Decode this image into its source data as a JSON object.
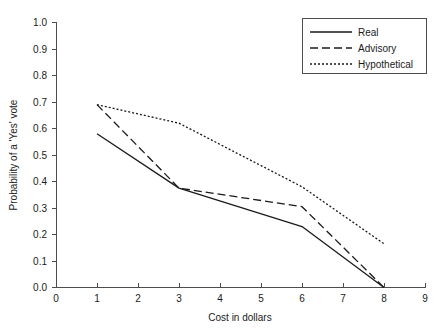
{
  "chart_data": {
    "type": "line",
    "title": "",
    "xlabel": "Cost in dollars",
    "ylabel": "Probability of a 'Yes' vote",
    "xlim": [
      0,
      9
    ],
    "ylim": [
      0,
      1.0
    ],
    "grid": false,
    "legend_position": "top-right",
    "xticks": [
      "0",
      "1",
      "2",
      "3",
      "4",
      "5",
      "6",
      "7",
      "8",
      "9"
    ],
    "yticks": [
      "0.0",
      "0.1",
      "0.2",
      "0.3",
      "0.4",
      "0.5",
      "0.6",
      "0.7",
      "0.8",
      "0.9",
      "1.0"
    ],
    "x": [
      1,
      3,
      6,
      8
    ],
    "series": [
      {
        "name": "Real",
        "style": "solid",
        "values": [
          0.58,
          0.375,
          0.23,
          0.0
        ]
      },
      {
        "name": "Advisory",
        "style": "dashed",
        "values": [
          0.69,
          0.375,
          0.305,
          0.0
        ]
      },
      {
        "name": "Hypothetical",
        "style": "dotted",
        "values": [
          0.69,
          0.62,
          0.38,
          0.165
        ]
      }
    ]
  },
  "legend": {
    "items": [
      {
        "label": "Real"
      },
      {
        "label": "Advisory"
      },
      {
        "label": "Hypothetical"
      }
    ]
  },
  "axes": {
    "x_title": "Cost in dollars",
    "y_title": "Probability of a 'Yes' vote"
  }
}
